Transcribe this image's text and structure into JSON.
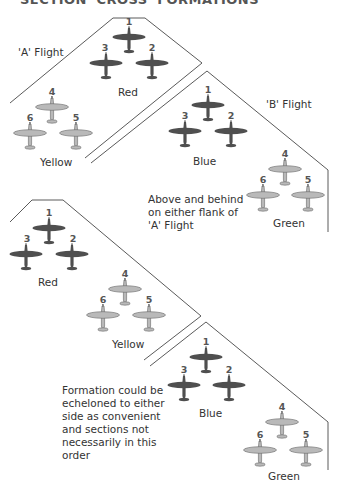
{
  "title": "SECTION 'CROSS' FORMATIONS",
  "colors": {
    "dark_aircraft": "#4f4f4f",
    "light_aircraft": "#b9b9b9",
    "outline": "#555555",
    "text": "#333333"
  },
  "diagrams": [
    {
      "name": "cross-over-formation",
      "flight_labels": {
        "a": "'A' Flight",
        "b": "'B' Flight"
      },
      "sections": [
        {
          "name": "Red",
          "tone": "dark",
          "numbers": [
            "1",
            "2",
            "3"
          ]
        },
        {
          "name": "Yellow",
          "tone": "light",
          "numbers": [
            "4",
            "5",
            "6"
          ]
        },
        {
          "name": "Blue",
          "tone": "dark",
          "numbers": [
            "1",
            "2",
            "3"
          ]
        },
        {
          "name": "Green",
          "tone": "light",
          "numbers": [
            "4",
            "5",
            "6"
          ]
        }
      ],
      "note": "Above and behind\non either flank of\n'A' Flight"
    },
    {
      "name": "echelon-formation",
      "sections": [
        {
          "name": "Red",
          "tone": "dark",
          "numbers": [
            "1",
            "2",
            "3"
          ]
        },
        {
          "name": "Yellow",
          "tone": "light",
          "numbers": [
            "4",
            "5",
            "6"
          ]
        },
        {
          "name": "Blue",
          "tone": "dark",
          "numbers": [
            "1",
            "2",
            "3"
          ]
        },
        {
          "name": "Green",
          "tone": "light",
          "numbers": [
            "4",
            "5",
            "6"
          ]
        }
      ],
      "note": "Formation could be\necheloned to either\nside as convenient\nand sections not\nnecessarily in this\norder"
    }
  ]
}
